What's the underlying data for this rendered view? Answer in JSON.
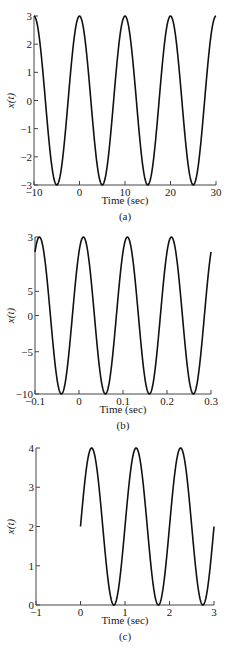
{
  "chart_data": [
    {
      "type": "line",
      "panel_label": "(a)",
      "title": "",
      "xlabel": "Time (sec)",
      "ylabel": "x(t)",
      "xlim": [
        -10,
        30
      ],
      "ylim": [
        -3,
        3
      ],
      "xticks": [
        -10,
        0,
        10,
        20,
        30
      ],
      "xtick_labels": [
        "−10",
        "0",
        "10",
        "20",
        "30"
      ],
      "yticks": [
        3,
        2,
        1,
        0,
        -1,
        -2,
        -3
      ],
      "ytick_labels": [
        "3",
        "2",
        "1",
        "0",
        "−1",
        "−2",
        "−3"
      ],
      "grid": false,
      "series": [
        {
          "name": "x(t)",
          "formula": "3*cos(2*pi*t/10)",
          "amplitude": 3,
          "offset": 0,
          "period": 10,
          "phase_peak_t": 0,
          "t_range": [
            -10,
            30
          ],
          "x": [
            -10,
            -5,
            0,
            5,
            10,
            15,
            20,
            25,
            30
          ],
          "values": [
            3,
            -3,
            3,
            -3,
            3,
            -3,
            3,
            -3,
            3
          ]
        }
      ],
      "plot_box": {
        "left": 34,
        "top": 16,
        "right": 216,
        "bottom": 185
      },
      "label_y": {
        "xlabel": 204,
        "panel": 220
      }
    },
    {
      "type": "line",
      "panel_label": "(b)",
      "title": "",
      "xlabel": "Time (sec)",
      "ylabel": "x(t)",
      "xlim": [
        -0.1,
        0.3
      ],
      "ylim": [
        -10,
        3
      ],
      "xticks": [
        -0.1,
        0,
        0.1,
        0.2,
        0.3
      ],
      "xtick_labels": [
        "−0.1",
        "0",
        "0.1",
        "0.2",
        "0.3"
      ],
      "yticks": [
        3,
        5,
        0,
        -5,
        -10
      ],
      "ytick_values_pos": [
        3,
        -1.5,
        -3.5,
        -6.5,
        -10
      ],
      "ytick_labels": [
        "3",
        "5",
        "0",
        "−5",
        "−10"
      ],
      "grid": false,
      "series": [
        {
          "name": "x(t)",
          "amplitude": 6.5,
          "offset": -3.5,
          "period": 0.1,
          "phase_peak_t": 0.01,
          "t_range": [
            -0.1,
            0.3
          ],
          "x": [
            -0.09,
            -0.04,
            0.01,
            0.06,
            0.11,
            0.16,
            0.21,
            0.26
          ],
          "values": [
            3,
            -10,
            3,
            -10,
            3,
            -10,
            3,
            -10
          ]
        }
      ],
      "plot_box": {
        "left": 35,
        "top": 237,
        "right": 211,
        "bottom": 394
      },
      "label_y": {
        "xlabel": 413,
        "panel": 429
      }
    },
    {
      "type": "line",
      "panel_label": "(c)",
      "title": "",
      "xlabel": "Time (sec)",
      "ylabel": "x(t)",
      "xlim": [
        -1,
        3
      ],
      "ylim": [
        0,
        4
      ],
      "xticks": [
        -1,
        0,
        1,
        2,
        3
      ],
      "xtick_labels": [
        "−1",
        "0",
        "1",
        "2",
        "3"
      ],
      "yticks": [
        4,
        3,
        2,
        1,
        0
      ],
      "ytick_labels": [
        "4",
        "3",
        "2",
        "1",
        "0"
      ],
      "grid": false,
      "series": [
        {
          "name": "x(t)",
          "formula": "2 + 2*sin(2*pi*t)",
          "amplitude": 2,
          "offset": 2,
          "period": 1,
          "phase_peak_t": 0.25,
          "t_range": [
            0,
            3
          ],
          "x": [
            0,
            0.25,
            0.75,
            1.25,
            1.75,
            2.25,
            2.75,
            3
          ],
          "values": [
            2,
            4,
            0,
            4,
            0,
            4,
            0,
            2
          ]
        }
      ],
      "plot_box": {
        "left": 36,
        "top": 448,
        "right": 214,
        "bottom": 605
      },
      "label_y": {
        "xlabel": 624,
        "panel": 640
      }
    }
  ]
}
